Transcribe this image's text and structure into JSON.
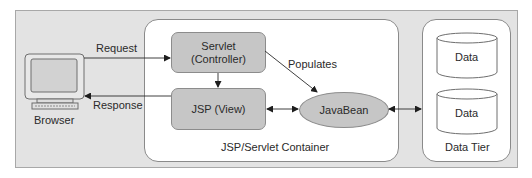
{
  "diagram": {
    "client": {
      "label": "Browser",
      "icon": "computer-monitor-icon"
    },
    "flows": {
      "request_label": "Request",
      "response_label": "Response",
      "populates_label": "Populates"
    },
    "container": {
      "label": "JSP/Servlet Container",
      "servlet": {
        "line1": "Servlet",
        "line2": "(Controller)"
      },
      "jsp": {
        "label": "JSP (View)"
      },
      "javabean": {
        "label": "JavaBean"
      }
    },
    "data_tier": {
      "label": "Data Tier",
      "stores": [
        {
          "label": "Data",
          "icon": "database-cylinder-icon"
        },
        {
          "label": "Data",
          "icon": "database-cylinder-icon"
        }
      ]
    },
    "edges": [
      {
        "from": "Browser",
        "to": "Servlet (Controller)",
        "label": "Request",
        "direction": "forward"
      },
      {
        "from": "Servlet (Controller)",
        "to": "JSP (View)",
        "label": "",
        "direction": "forward"
      },
      {
        "from": "Servlet (Controller)",
        "to": "JavaBean",
        "label": "Populates",
        "direction": "forward"
      },
      {
        "from": "JSP (View)",
        "to": "Browser",
        "label": "Response",
        "direction": "forward"
      },
      {
        "from": "JSP (View)",
        "to": "JavaBean",
        "label": "",
        "direction": "bidirectional"
      },
      {
        "from": "JavaBean",
        "to": "Data Tier",
        "label": "",
        "direction": "bidirectional"
      }
    ],
    "colors": {
      "outer_background": "#e3e3e3",
      "panel_background": "#ffffff",
      "node_fill": "#c6c6c6",
      "stroke": "#2a2a2a"
    }
  }
}
